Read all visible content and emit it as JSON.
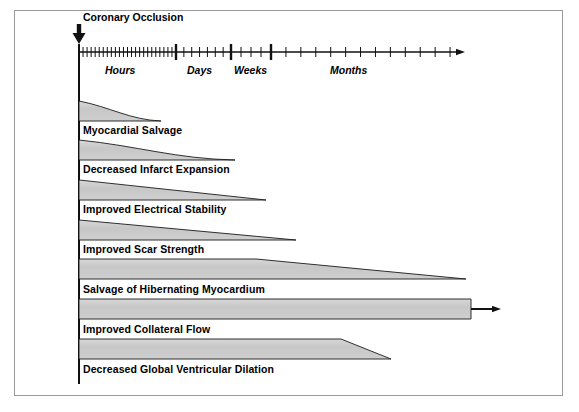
{
  "figure": {
    "title_annotation": "Coronary Occlusion",
    "frame_color": "#9a9a9a",
    "bar_fill": "#c9c9c9",
    "bar_stroke": "#1a1a1a",
    "axis_color": "#111111",
    "background": "#ffffff"
  },
  "timeline": {
    "axis_label_hours": "Hours",
    "axis_label_days": "Days",
    "axis_label_weeks": "Weeks",
    "axis_label_months": "Months",
    "origin_x": 79,
    "axis_y": 52,
    "arrow_end_x": 465,
    "major_divider_x": [
      79,
      176,
      231,
      271
    ],
    "hours_tick_count": 24,
    "days_tick_count": 7,
    "weeks_tick_count": 4,
    "months_tick_count": 13
  },
  "bars": [
    {
      "label": "Myocardial Salvage",
      "shape": "concave-taper",
      "start_x": 79,
      "end_x": 161,
      "top_y": 101,
      "height": 20,
      "label_y": 124,
      "arrow": false
    },
    {
      "label": "Decreased Infarct Expansion",
      "shape": "concave-taper",
      "start_x": 79,
      "end_x": 235,
      "top_y": 140,
      "height": 20,
      "label_y": 163,
      "arrow": false
    },
    {
      "label": "Improved Electrical Stability",
      "shape": "linear-taper",
      "start_x": 79,
      "end_x": 266,
      "top_y": 180,
      "height": 20,
      "label_y": 203,
      "arrow": false
    },
    {
      "label": "Improved Scar Strength",
      "shape": "linear-taper",
      "start_x": 79,
      "end_x": 296,
      "top_y": 220,
      "height": 20,
      "label_y": 243,
      "arrow": false
    },
    {
      "label": "Salvage of Hibernating Myocardium",
      "shape": "plateau-taper",
      "start_x": 79,
      "plateau_x": 256,
      "end_x": 466,
      "top_y": 259,
      "height": 20,
      "label_y": 283,
      "arrow": false
    },
    {
      "label": "Improved Collateral Flow",
      "shape": "constant",
      "start_x": 79,
      "end_x": 471,
      "top_y": 299,
      "height": 20,
      "label_y": 323,
      "arrow": true,
      "arrow_end_x": 501
    },
    {
      "label": "Decreased Global Ventricular Dilation",
      "shape": "plateau-taper",
      "start_x": 79,
      "plateau_x": 341,
      "end_x": 391,
      "top_y": 339,
      "height": 20,
      "label_y": 363,
      "arrow": false
    }
  ]
}
